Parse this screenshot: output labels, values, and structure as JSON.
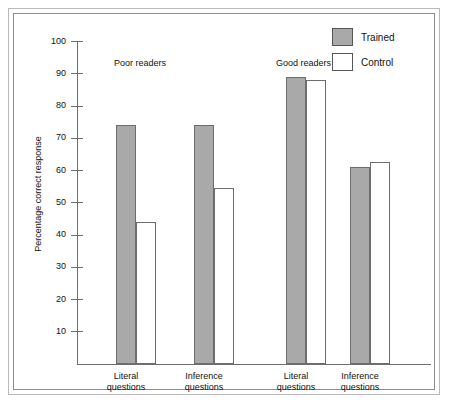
{
  "chart_data": {
    "type": "bar",
    "title": "",
    "xlabel": "",
    "ylabel": "Percentage correct response",
    "ylim": [
      0,
      100
    ],
    "ytick_values": [
      100,
      90,
      80,
      70,
      60,
      50,
      40,
      30,
      20,
      10
    ],
    "ytick_labels": [
      "100",
      "90",
      "80",
      "70",
      "60",
      "50",
      "40",
      "30",
      "20",
      "10"
    ],
    "grid": false,
    "legend_position": "top-right",
    "group_headings": [
      "Poor readers",
      "Good readers"
    ],
    "categories": [
      "Literal questions",
      "Inference questions",
      "Literal questions",
      "Inference questions"
    ],
    "category_lines": [
      [
        "Literal",
        "questions"
      ],
      [
        "Inference",
        "questions"
      ],
      [
        "Literal",
        "questions"
      ],
      [
        "Inference",
        "questions"
      ]
    ],
    "series": [
      {
        "name": "Trained",
        "color": "#a9a9a9",
        "values": [
          74,
          74,
          89,
          61
        ]
      },
      {
        "name": "Control",
        "color": "#ffffff",
        "values": [
          44,
          54.5,
          88,
          62.5
        ]
      }
    ]
  },
  "legend": {
    "items": [
      {
        "label": "Trained",
        "style": "trained"
      },
      {
        "label": "Control",
        "style": "control"
      }
    ]
  },
  "colors": {
    "trained_fill": "#a9a9a9",
    "control_fill": "#ffffff",
    "bar_stroke": "#6d6d6d",
    "axis": "#6e6e6e",
    "frame_outer": "#b9b9b9",
    "frame_inner": "#8d8d8d",
    "text": "#111111"
  }
}
